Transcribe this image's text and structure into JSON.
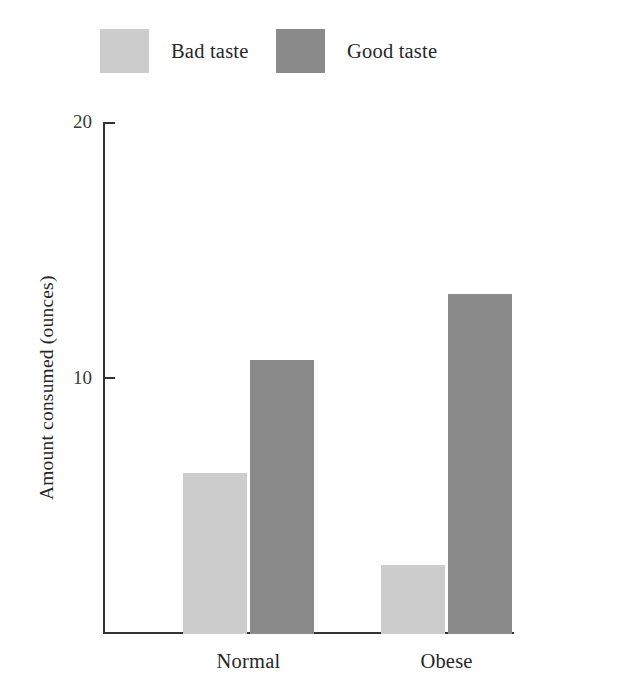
{
  "chart_data": {
    "type": "bar",
    "title": "",
    "xlabel": "",
    "ylabel": "Amount consumed (ounces)",
    "categories": [
      "Normal",
      "Obese"
    ],
    "series": [
      {
        "name": "Bad taste",
        "values": [
          6.3,
          2.7
        ],
        "color": "#cccccc"
      },
      {
        "name": "Good taste",
        "values": [
          10.7,
          13.3
        ],
        "color": "#8a8a8a"
      }
    ],
    "ylim": [
      0,
      20
    ],
    "yticks": [
      10,
      20
    ],
    "ytick_labels": [
      "10",
      "20"
    ],
    "grid": false,
    "legend_position": "top"
  },
  "legend": {
    "entries": [
      {
        "label": "Bad taste",
        "color": "#cccccc"
      },
      {
        "label": "Good taste",
        "color": "#8a8a8a"
      }
    ]
  },
  "axes": {
    "y_title": "Amount consumed (ounces)",
    "y_tick_20": "20",
    "y_tick_10": "10",
    "x_category_0": "Normal",
    "x_category_1": "Obese"
  }
}
